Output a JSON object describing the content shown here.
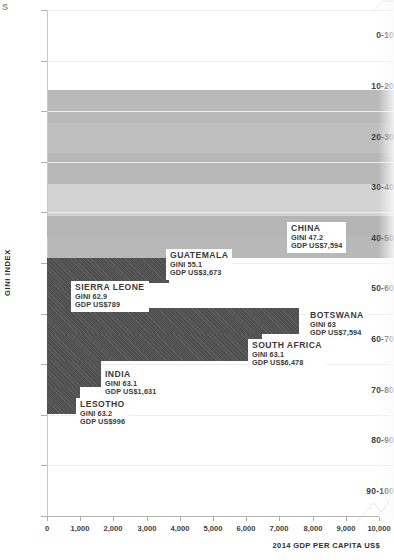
{
  "chart_data": {
    "type": "bar",
    "title": "",
    "xlabel": "2014 GDP PER CAPITA US$",
    "ylabel": "GINI INDEX",
    "xlim": [
      0,
      10000
    ],
    "grid": true,
    "orientation": "horizontal",
    "legend": "none",
    "x_ticks": [
      "0",
      "1,000",
      "2,000",
      "3,000",
      "4,000",
      "5,000",
      "6,000",
      "7,000",
      "8,000",
      "9,000",
      "10,000"
    ],
    "x_tick_values": [
      0,
      1000,
      2000,
      3000,
      4000,
      5000,
      6000,
      7000,
      8000,
      9000,
      10000
    ],
    "y_categories": [
      "0-10",
      "10-20",
      "20-30",
      "30-40",
      "40-50",
      "50-60",
      "60-70",
      "70-80",
      "80-90",
      "90-100"
    ],
    "series": [
      {
        "name": "CHINA",
        "gini_label": "GINI 47.2",
        "gdp_label": "GDP US$7,594",
        "gini": 47.2,
        "gdp": 7594,
        "gini_band": "40-50",
        "shade": "light"
      },
      {
        "name": "GUATEMALA",
        "gini_label": "GINI 55.1",
        "gdp_label": "GDP US$3,673",
        "gini": 55.1,
        "gdp": 3673,
        "gini_band": "50-60",
        "shade": "dark"
      },
      {
        "name": "SIERRA LEONE",
        "gini_label": "GINI 62.9",
        "gdp_label": "GDP US$789",
        "gini": 62.9,
        "gdp": 789,
        "gini_band": "60-70",
        "shade": "dark"
      },
      {
        "name": "BOTSWANA",
        "gini_label": "GINI 63",
        "gdp_label": "GDP US$7,594",
        "gini": 63,
        "gdp": 7594,
        "gini_band": "60-70",
        "shade": "dark"
      },
      {
        "name": "SOUTH AFRICA",
        "gini_label": "GINI 63.1",
        "gdp_label": "GDP US$6,478",
        "gini": 63.1,
        "gdp": 6478,
        "gini_band": "60-70",
        "shade": "dark"
      },
      {
        "name": "INDIA",
        "gini_label": "GINI 63.1",
        "gdp_label": "GDP US$1,631",
        "gini": 63.1,
        "gdp": 1631,
        "gini_band": "60-70",
        "shade": "dark"
      },
      {
        "name": "LESOTHO",
        "gini_label": "GINI 63.2",
        "gdp_label": "GDP US$996",
        "gini": 63.2,
        "gdp": 996,
        "gini_band": "60-70",
        "shade": "dark"
      }
    ],
    "background_bands": [
      {
        "top": 90,
        "height": 33,
        "color": "#b9b9b9"
      },
      {
        "top": 123,
        "height": 30,
        "color": "#bfbfbf"
      },
      {
        "top": 153,
        "height": 31,
        "color": "#b7b7b7"
      },
      {
        "top": 184,
        "height": 32,
        "color": "#d2d2d2"
      },
      {
        "top": 216,
        "height": 20,
        "color": "#b4b4b4"
      },
      {
        "top": 236,
        "height": 22,
        "color": "#b8b8b8"
      }
    ],
    "colors": {
      "bar_dark": "#4f4f4f",
      "bar_light": "#b6b6b6",
      "band_light": "#d2d2d2",
      "band_mid": "#bfbfbf",
      "axis": "#b5b5b5",
      "text": "#3d3d3d"
    }
  },
  "corner_glyph": "S"
}
